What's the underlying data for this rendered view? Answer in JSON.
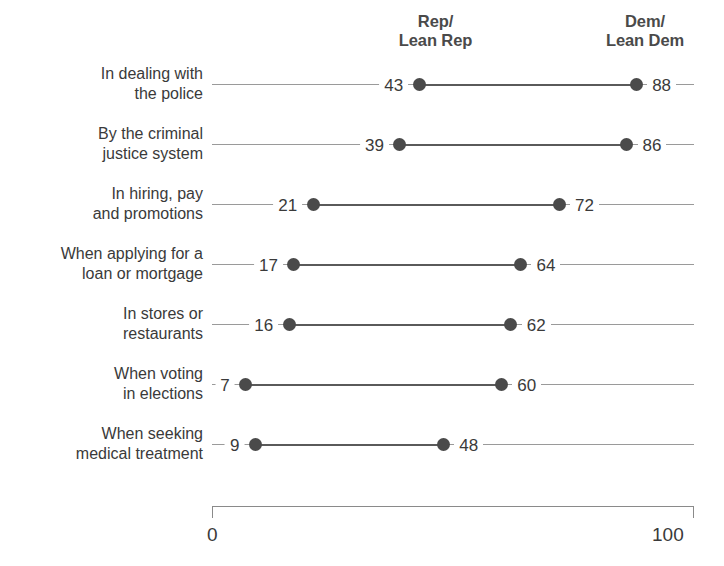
{
  "chart_data": {
    "type": "dot",
    "title": "",
    "subtitle": "",
    "xlabel": "",
    "ylabel": "",
    "xlim": [
      0,
      100
    ],
    "grid": false,
    "legend_position": "top",
    "axis_ticks": [
      "0",
      "100"
    ],
    "series": [
      {
        "name": "Rep/\nLean Rep",
        "values": [
          43,
          39,
          21,
          17,
          16,
          7,
          9
        ]
      },
      {
        "name": "Dem/\nLean Dem",
        "values": [
          88,
          86,
          72,
          64,
          62,
          60,
          48
        ]
      }
    ],
    "categories": [
      "In dealing with\nthe police",
      "By the criminal\njustice system",
      "In hiring, pay\nand promotions",
      "When applying for a\nloan or mortgage",
      "In stores or\nrestaurants",
      "When voting\nin elections",
      "When seeking\nmedical treatment"
    ],
    "rows": [
      {
        "category": "In dealing with\nthe police",
        "rep": 43,
        "dem": 88,
        "rep_label": "43",
        "dem_label": "88"
      },
      {
        "category": "By the criminal\njustice system",
        "rep": 39,
        "dem": 86,
        "rep_label": "39",
        "dem_label": "86"
      },
      {
        "category": "In hiring, pay\nand promotions",
        "rep": 21,
        "dem": 72,
        "rep_label": "21",
        "dem_label": "72"
      },
      {
        "category": "When applying for a\nloan or mortgage",
        "rep": 17,
        "dem": 64,
        "rep_label": "17",
        "dem_label": "64"
      },
      {
        "category": "In stores or\nrestaurants",
        "rep": 16,
        "dem": 62,
        "rep_label": "16",
        "dem_label": "62"
      },
      {
        "category": "When voting\nin elections",
        "rep": 7,
        "dem": 60,
        "rep_label": "7",
        "dem_label": "60"
      },
      {
        "category": "When seeking\nmedical treatment",
        "rep": 9,
        "dem": 48,
        "rep_label": "9",
        "dem_label": "48"
      }
    ]
  },
  "headers": {
    "rep": "Rep/\nLean Rep",
    "dem": "Dem/\nLean Dem"
  },
  "axis": {
    "min_label": "0",
    "max_label": "100"
  },
  "colors": {
    "dot": "#4a4a4a",
    "connector": "#5a5a5a",
    "guide": "#9a9a9a",
    "text": "#3a3a3a",
    "background": "#ffffff"
  }
}
